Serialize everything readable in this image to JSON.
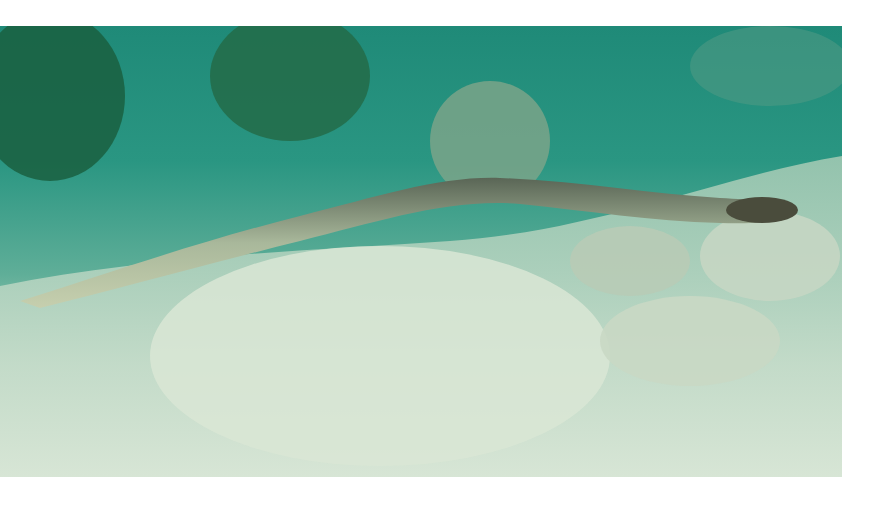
{
  "image": {
    "subject": "sea snake swimming over sandy reef bottom",
    "colors": {
      "water": "#1f8a78",
      "sand": "#cfe0cf",
      "coral": "#1e6b4a",
      "snake_body": "#a7b79a",
      "snake_pattern": "#4c5a4e",
      "snake_head": "#4a4c3c"
    }
  }
}
